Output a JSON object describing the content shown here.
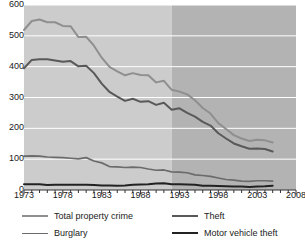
{
  "chart_data": {
    "type": "line",
    "title": "",
    "subtitle": "",
    "xlabel": "",
    "ylabel": "",
    "xlim": [
      1973,
      2008
    ],
    "ylim": [
      0,
      600
    ],
    "yticks": [
      0,
      100,
      200,
      300,
      400,
      500,
      600
    ],
    "xticks": [
      1973,
      1978,
      1983,
      1988,
      1993,
      1998,
      2003,
      2008
    ],
    "xtick_minor_step": 1,
    "grid": "horizontal-white",
    "legend_position": "bottom",
    "legend_columns": 2,
    "x": [
      1973,
      1974,
      1975,
      1976,
      1977,
      1978,
      1979,
      1980,
      1981,
      1982,
      1983,
      1984,
      1985,
      1986,
      1987,
      1988,
      1989,
      1990,
      1991,
      1992,
      1993,
      1994,
      1995,
      1996,
      1997,
      1998,
      1999,
      2000,
      2001,
      2002,
      2003,
      2004,
      2005
    ],
    "series": [
      {
        "name": "Total property crime",
        "color": "#8f8f8f",
        "width": 2.0,
        "values": [
          519,
          548,
          553,
          544,
          544,
          532,
          531,
          496,
          497,
          468,
          429,
          399,
          385,
          372,
          379,
          373,
          372,
          349,
          354,
          325,
          319,
          310,
          291,
          266,
          248,
          217,
          198,
          178,
          167,
          159,
          163,
          161,
          154
        ]
      },
      {
        "name": "Theft",
        "color": "#595959",
        "width": 2.0,
        "values": [
          395,
          422,
          424,
          424,
          420,
          416,
          418,
          401,
          403,
          379,
          345,
          318,
          303,
          289,
          296,
          286,
          288,
          276,
          283,
          260,
          265,
          250,
          238,
          221,
          209,
          184,
          167,
          151,
          142,
          134,
          135,
          133,
          125
        ]
      },
      {
        "name": "Burglary",
        "color": "#6b6b6b",
        "width": 1.7,
        "values": [
          110,
          111,
          110,
          107,
          106,
          105,
          103,
          101,
          105,
          94,
          88,
          76,
          75,
          73,
          74,
          73,
          68,
          64,
          65,
          59,
          58,
          56,
          49,
          47,
          44,
          39,
          34,
          32,
          29,
          28,
          30,
          30,
          29
        ]
      },
      {
        "name": "Motor vehicle theft",
        "color": "#222222",
        "width": 2.0,
        "values": [
          19,
          19,
          19,
          16,
          17,
          17,
          17,
          17,
          17,
          16,
          15,
          15,
          14,
          15,
          17,
          18,
          19,
          21,
          22,
          19,
          19,
          18,
          17,
          14,
          14,
          13,
          12,
          11,
          11,
          10,
          11,
          12,
          14
        ]
      }
    ],
    "shaded_regions": [
      {
        "name": "pre-redesign",
        "from": 1973,
        "to": 1992,
        "color": "#cccccc"
      },
      {
        "name": "post-redesign",
        "from": 1992,
        "to": 2008,
        "color": "#b3b3b3"
      }
    ],
    "gridline_color": "#ffffff",
    "axis_color": "#333333"
  },
  "axes": {
    "y_tick_labels": [
      "0",
      "100",
      "200",
      "300",
      "400",
      "500",
      "600"
    ],
    "x_tick_labels": [
      "1973",
      "1978",
      "1983",
      "1988",
      "1993",
      "1998",
      "2003",
      "2008"
    ]
  },
  "legend": {
    "items": [
      {
        "label": "Total property crime",
        "color": "#8f8f8f",
        "width": "2.0px"
      },
      {
        "label": "Theft",
        "color": "#595959",
        "width": "2.0px"
      },
      {
        "label": "Burglary",
        "color": "#6b6b6b",
        "width": "1.7px"
      },
      {
        "label": "Motor vehicle theft",
        "color": "#222222",
        "width": "2.0px"
      }
    ]
  }
}
